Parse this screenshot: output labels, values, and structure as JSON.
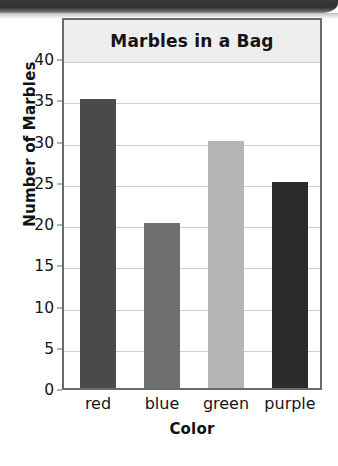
{
  "chart_data": {
    "type": "bar",
    "title": "Marbles in a Bag",
    "xlabel": "Color",
    "ylabel": "Number of Marbles",
    "categories": [
      "red",
      "blue",
      "green",
      "purple"
    ],
    "values": [
      35,
      20,
      30,
      25
    ],
    "ylim": [
      0,
      40
    ],
    "ytick_labels": [
      "0",
      "5",
      "10",
      "15",
      "20",
      "25",
      "30",
      "35",
      "40"
    ],
    "ytick_values": [
      0,
      5,
      10,
      15,
      20,
      25,
      30,
      35,
      40
    ],
    "ytick_step": 5,
    "grid": true,
    "legend": false,
    "bar_colors": [
      "#4a4a4a",
      "#6f6f6f",
      "#b5b5b5",
      "#2b2b2b"
    ],
    "title_banner_color": "#eeeeee",
    "frame_color": "#6b6b6b",
    "gridline_color": "#cfcfcf",
    "plot_background": "#ffffff"
  },
  "page": {
    "scan_band_color": "#2e2e2e"
  }
}
